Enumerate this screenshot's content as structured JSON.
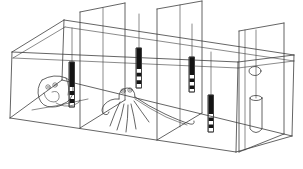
{
  "diagram": {
    "type": "hand-drawn line illustration",
    "background_color": "#ffffff",
    "line_color": "#3d3d3d",
    "rod_fill_color": "#141414",
    "rod_band_count": 4,
    "compartment_count": 4,
    "levers": [
      {
        "name": "lever-1",
        "x": 72,
        "wire_top": 28,
        "body_top": 62,
        "solid_bottom": 87,
        "band_bottom": 103,
        "tip_bottom": 107,
        "width": 5
      },
      {
        "name": "lever-2",
        "x": 139,
        "wire_top": 14,
        "body_top": 48,
        "solid_bottom": 69,
        "band_bottom": 84,
        "tip_bottom": 88,
        "width": 5
      },
      {
        "name": "lever-3",
        "x": 192,
        "wire_top": 24,
        "body_top": 57,
        "solid_bottom": 75,
        "band_bottom": 89,
        "tip_bottom": 92,
        "width": 5
      },
      {
        "name": "lever-4",
        "x": 211,
        "wire_top": 52,
        "body_top": 95,
        "solid_bottom": 114,
        "band_bottom": 128,
        "tip_bottom": 132,
        "width": 5
      }
    ],
    "hanging_cylinder": {
      "wire_x": 256,
      "wire_top": 30,
      "top": 98,
      "bottom": 129,
      "half_width": 6,
      "bottom_bulge": 7
    },
    "lid_hole": {
      "cx": 255,
      "cy": 71,
      "rx": 6,
      "ry": 4.5
    },
    "octopuses": [
      {
        "name": "octopus-in-den",
        "location": "left compartment, peering out of a horizontal den"
      },
      {
        "name": "octopus-spread",
        "location": "middle compartment, arms fanned, one long arm extended right along the floor"
      }
    ]
  }
}
